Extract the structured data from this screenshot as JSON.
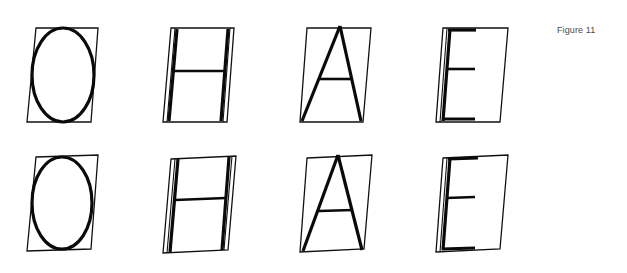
{
  "figure": {
    "caption": "Figure 11",
    "colors": {
      "background": "#ffffff",
      "ink": "#0a0a0a",
      "caption": "#4a4a4a"
    },
    "rows": [
      {
        "id": "top",
        "letters": [
          {
            "glyph": "O",
            "frame": "parallelogram skewed right"
          },
          {
            "glyph": "H",
            "frame": "parallelogram skewed right"
          },
          {
            "glyph": "A",
            "frame": "parallelogram skewed right"
          },
          {
            "glyph": "E",
            "frame": "parallelogram skewed right"
          }
        ]
      },
      {
        "id": "bottom",
        "letters": [
          {
            "glyph": "O",
            "frame": "parallelogram skewed and rotated"
          },
          {
            "glyph": "H",
            "frame": "parallelogram skewed and rotated"
          },
          {
            "glyph": "A",
            "frame": "parallelogram skewed and rotated"
          },
          {
            "glyph": "E",
            "frame": "parallelogram skewed and rotated"
          }
        ]
      }
    ]
  }
}
